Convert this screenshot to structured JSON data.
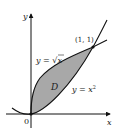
{
  "diagram": {
    "type": "region-between-curves",
    "axes": {
      "x_label": "x",
      "y_label": "y",
      "origin_label": "0"
    },
    "curves": [
      {
        "name": "sqrt",
        "label_prefix": "y = ",
        "label_expr": "x",
        "label_full": "y = √x",
        "sqrt_symbol": "√"
      },
      {
        "name": "square",
        "label_prefix": "y = x",
        "label_exp": "2",
        "label_full": "y = x²"
      }
    ],
    "region": {
      "label": "D",
      "fill": "#a8a8a8"
    },
    "intersection_point": {
      "label": "(1, 1)",
      "x": 1,
      "y": 1
    },
    "colors": {
      "stroke": "#111111",
      "fill": "#a8a8a8",
      "text": "#222222"
    }
  }
}
